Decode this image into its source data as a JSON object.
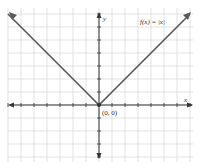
{
  "chart_data": {
    "type": "line",
    "title": "",
    "function_label": "f(x) = |x|",
    "xlabel": "x",
    "ylabel": "y",
    "annotations": [
      {
        "text": "(0, 0)",
        "x": 0,
        "y": 0
      }
    ],
    "series": [
      {
        "name": "f(x) = |x|",
        "x": [
          -7,
          -6,
          -5,
          -4,
          -3,
          -2,
          -1,
          0,
          1,
          2,
          3,
          4,
          5,
          6,
          7
        ],
        "values": [
          7,
          6,
          5,
          4,
          3,
          2,
          1,
          0,
          1,
          2,
          3,
          4,
          5,
          6,
          7
        ]
      }
    ],
    "xlim": [
      -7.5,
      7.5
    ],
    "ylim": [
      -4,
      7
    ],
    "grid": true,
    "legend": "none",
    "colors": {
      "line": "#555555",
      "grid": "#d4d4d4",
      "axis": "#333333"
    }
  }
}
